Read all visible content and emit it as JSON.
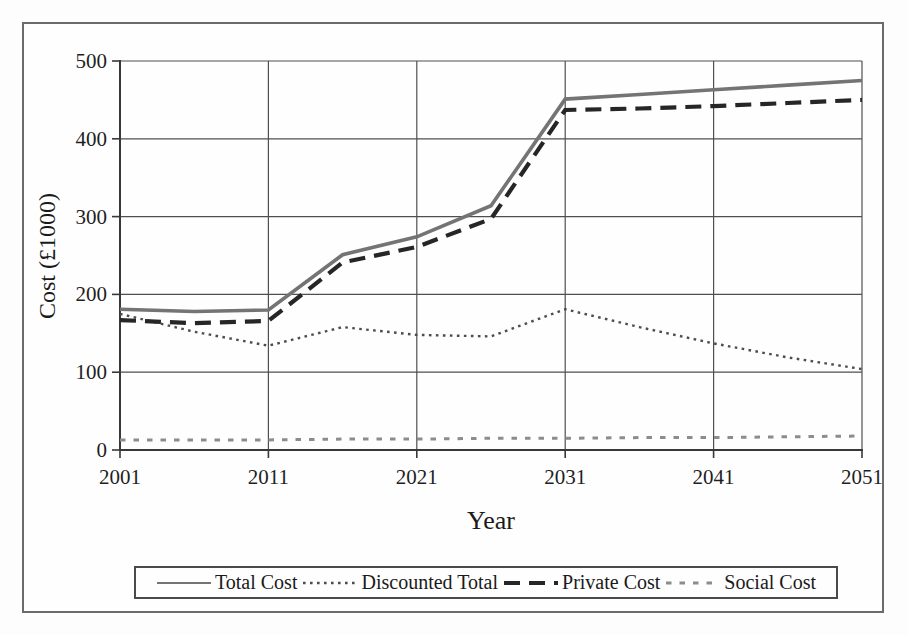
{
  "figure": {
    "background": "#fdfdfd",
    "border_color": "#6b6b6b",
    "grid_color": "#4f4f4f",
    "axis_color": "#383838"
  },
  "chart_data": {
    "type": "line",
    "title": "",
    "xlabel": "Year",
    "ylabel": "Cost (£1000)",
    "xlim": [
      2001,
      2051
    ],
    "ylim": [
      0,
      500
    ],
    "x_tick_values": [
      2001,
      2011,
      2021,
      2031,
      2041,
      2051
    ],
    "y_tick_values": [
      0,
      100,
      200,
      300,
      400,
      500
    ],
    "grid": true,
    "legend_position": "bottom",
    "x": [
      2001,
      2006,
      2011,
      2016,
      2021,
      2026,
      2031,
      2036,
      2041,
      2046,
      2051
    ],
    "series": [
      {
        "name": "Total Cost",
        "line_style": "solid",
        "color": "#747474",
        "width": 3.6,
        "values": [
          181,
          178,
          180,
          251,
          274,
          314,
          451,
          457,
          463,
          469,
          475
        ]
      },
      {
        "name": "Discounted Total",
        "line_style": "dotted",
        "color": "#4d4d4d",
        "width": 2.4,
        "values": [
          175,
          152,
          134,
          158,
          148,
          146,
          181,
          158,
          137,
          119,
          104
        ]
      },
      {
        "name": "Private Cost",
        "line_style": "dashed",
        "color": "#262626",
        "width": 4.2,
        "values": [
          167,
          163,
          166,
          241,
          261,
          297,
          437,
          439,
          442,
          446,
          450
        ]
      },
      {
        "name": "Social Cost",
        "line_style": "short-dash",
        "color": "#8c8c8c",
        "width": 3,
        "values": [
          13,
          13,
          13,
          14,
          14,
          15,
          15,
          16,
          16,
          17,
          18
        ]
      }
    ]
  }
}
